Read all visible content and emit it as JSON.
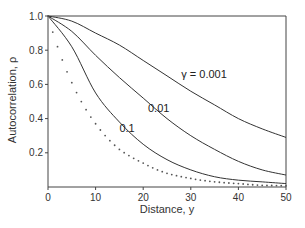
{
  "chart_data": {
    "type": "line",
    "title": "",
    "xlabel": "Distance, y",
    "ylabel": "Autocorrelation, ρ",
    "xlim": [
      0,
      50
    ],
    "ylim": [
      0,
      1.0
    ],
    "xticks": [
      0,
      10,
      20,
      30,
      40,
      50
    ],
    "xtick_labels": [
      "0",
      "10",
      "20",
      "30",
      "40",
      "50"
    ],
    "yticks": [
      0.2,
      0.4,
      0.6,
      0.8,
      1.0
    ],
    "ytick_labels": [
      "0.2",
      "0.4",
      "0.6",
      "0.8",
      "1.0"
    ],
    "grid": false,
    "legend": "none",
    "x": [
      0,
      5,
      10,
      15,
      20,
      25,
      30,
      35,
      40,
      45,
      50
    ],
    "series": [
      {
        "name": "γ = 0.001",
        "label": "γ = 0.001",
        "style": "solid",
        "values": [
          1.0,
          0.97,
          0.9,
          0.83,
          0.74,
          0.65,
          0.56,
          0.48,
          0.4,
          0.34,
          0.29
        ]
      },
      {
        "name": "0.01",
        "label": "0.01",
        "style": "solid",
        "values": [
          1.0,
          0.91,
          0.77,
          0.64,
          0.52,
          0.4,
          0.3,
          0.22,
          0.15,
          0.1,
          0.07
        ]
      },
      {
        "name": "0.1",
        "label": "0.1",
        "style": "solid",
        "values": [
          1.0,
          0.82,
          0.55,
          0.38,
          0.25,
          0.16,
          0.1,
          0.06,
          0.04,
          0.03,
          0.02
        ]
      },
      {
        "name": "dotted",
        "label": "",
        "style": "dotted",
        "values": [
          1.0,
          0.61,
          0.37,
          0.22,
          0.14,
          0.08,
          0.05,
          0.03,
          0.02,
          0.01,
          0.007
        ]
      }
    ],
    "annotations": [
      {
        "text": "γ = 0.001",
        "x": 28,
        "y": 0.64
      },
      {
        "text": "0.01",
        "x": 21,
        "y": 0.44
      },
      {
        "text": "0.1",
        "x": 15,
        "y": 0.32
      }
    ]
  }
}
